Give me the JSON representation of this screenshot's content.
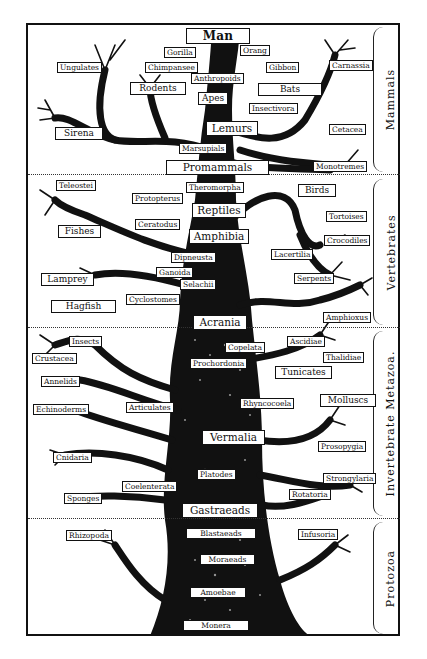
{
  "diagram": {
    "sections": [
      {
        "name": "Mammals",
        "top": 25,
        "bottom": 174
      },
      {
        "name": "Vertebrates",
        "top": 176,
        "bottom": 327
      },
      {
        "name": "Invertebrate Metazoa.",
        "top": 329,
        "bottom": 518
      },
      {
        "name": "Protozoa",
        "top": 520,
        "bottom": 634
      }
    ],
    "labels": {
      "man": "Man",
      "gorilla": "Gorilla",
      "orang": "Orang",
      "chimpanzee": "Chimpansee",
      "gibbon": "Gibbon",
      "ungulates": "Ungulates",
      "carnassia": "Carnassia",
      "anthropoids": "Anthropoids",
      "rodents": "Rodents",
      "bats": "Bats",
      "apes": "Apes",
      "insectivora": "Insectivora",
      "lemurs": "Lemurs",
      "cetacea": "Cetacea",
      "sirena": "Sirena",
      "marsupials": "Marsupials",
      "promammals": "Promammals",
      "monotremes": "Monotremes",
      "teleostei": "Teleostei",
      "theromorpha": "Theromorpha",
      "protopterus": "Protopterus",
      "birds": "Birds",
      "reptiles": "Reptiles",
      "tortoises": "Tortoises",
      "fishes": "Fishes",
      "ceratodus": "Ceratodus",
      "amphibia": "Amphibia",
      "crocodiles": "Crocodiles",
      "dipneusta": "Dipneusta",
      "lacertilia": "Lacertilia",
      "ganoida": "Ganoida",
      "lamprey": "Lamprey",
      "selachii": "Selachii",
      "serpents": "Serpents",
      "hagfish": "Hagfish",
      "cyclostomes": "Cyclostomes",
      "acrania": "Acrania",
      "amphioxus": "Amphioxus",
      "insects": "Insects",
      "ascidiae": "Ascidiae",
      "crustacea": "Crustacea",
      "copelata": "Copelata",
      "thalidiae": "Thalidiae",
      "prochordonia": "Prochordonia",
      "annelids": "Annelids",
      "tunicates": "Tunicates",
      "echinoderms": "Echinoderms",
      "articulates": "Articulates",
      "rhyncocoela": "Rhyncocoela",
      "molluscs": "Molluscs",
      "vermalia": "Vermalia",
      "prosopygia": "Prosopygia",
      "cnidaria": "Cnidaria",
      "platodes": "Platodes",
      "strongylaria": "Strongylaria",
      "coelenterata": "Coelenterata",
      "rotatoria": "Rotatoria",
      "sponges": "Sponges",
      "gastraeads": "Gastraeads",
      "rhizopoda": "Rhizopoda",
      "blastaeads": "Blastaeads",
      "infusoria": "Infusoria",
      "moraeads": "Moraeads",
      "amoebae": "Amoebae",
      "monera": "Monera"
    }
  }
}
